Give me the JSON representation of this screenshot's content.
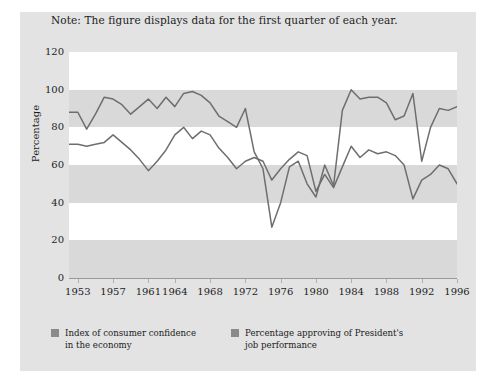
{
  "note": "Note: The figure displays data for the first quarter of each year.",
  "colors": {
    "figure_background": "#e3e3e3",
    "band_white": "#ffffff",
    "band_gray": "#d9d9d9",
    "line": "#6e6e6e",
    "axis": "#9a9a9a",
    "text": "#1c1c1c",
    "legend_swatch": "#8a8a8a"
  },
  "axes": {
    "ylabel": "Percentage",
    "yticks": [
      120,
      100,
      80,
      60,
      40,
      20,
      0
    ],
    "xticks": [
      1953,
      1957,
      1961,
      1964,
      1968,
      1972,
      1976,
      1980,
      1984,
      1988,
      1992,
      1996
    ]
  },
  "legend": {
    "items": [
      {
        "label_line1": "Index of consumer confidence",
        "label_line2": "in the economy",
        "swatch": "#8a8a8a"
      },
      {
        "label_line1": "Percentage approving of President's",
        "label_line2": "job performance",
        "swatch": "#8a8a8a"
      }
    ]
  },
  "chart_data": {
    "type": "line",
    "title": "",
    "subtitle": "Note: The figure displays data for the first quarter of each year.",
    "xlabel": "",
    "ylabel": "Percentage",
    "ylim": [
      0,
      120
    ],
    "xlim": [
      1952,
      1996
    ],
    "grid": "horizontal alternating shaded bands every 20 percentage points",
    "legend_position": "below plot, left aligned, two columns",
    "x": [
      1952,
      1953,
      1954,
      1955,
      1956,
      1957,
      1958,
      1959,
      1960,
      1961,
      1962,
      1963,
      1964,
      1965,
      1966,
      1967,
      1968,
      1969,
      1970,
      1971,
      1972,
      1973,
      1974,
      1975,
      1976,
      1977,
      1978,
      1979,
      1980,
      1981,
      1982,
      1983,
      1984,
      1985,
      1986,
      1987,
      1988,
      1989,
      1990,
      1991,
      1992,
      1993,
      1994,
      1995,
      1996
    ],
    "series": [
      {
        "name": "Index of consumer confidence in the economy",
        "values": [
          71,
          71,
          70,
          71,
          72,
          76,
          72,
          68,
          63,
          57,
          62,
          68,
          76,
          80,
          74,
          78,
          76,
          69,
          64,
          58,
          62,
          64,
          62,
          52,
          58,
          63,
          67,
          65,
          46,
          55,
          48,
          59,
          70,
          64,
          68,
          66,
          67,
          65,
          60,
          42,
          52,
          55,
          60,
          58,
          50
        ]
      },
      {
        "name": "Percentage approving of President's job performance",
        "values": [
          88,
          88,
          79,
          87,
          96,
          95,
          92,
          87,
          91,
          95,
          90,
          96,
          91,
          98,
          99,
          97,
          93,
          86,
          83,
          80,
          90,
          67,
          58,
          27,
          40,
          59,
          62,
          50,
          43,
          60,
          49,
          89,
          100,
          95,
          96,
          96,
          93,
          84,
          86,
          98,
          62,
          80,
          90,
          89,
          91
        ]
      }
    ]
  }
}
